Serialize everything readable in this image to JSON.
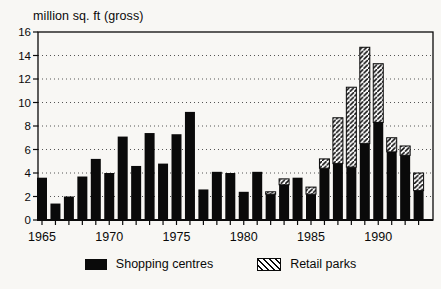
{
  "chart_data": {
    "type": "bar",
    "stacked": true,
    "title": "million sq. ft (gross)",
    "xlabel": "",
    "ylabel": "million sq. ft (gross)",
    "ylim": [
      0,
      16
    ],
    "ytick_step": 2,
    "grid": "dotted horizontal gridlines at each y tick",
    "legend_position": "bottom-center",
    "categories": [
      "1965",
      "1966",
      "1967",
      "1968",
      "1969",
      "1970",
      "1971",
      "1972",
      "1973",
      "1974",
      "1975",
      "1976",
      "1977",
      "1978",
      "1979",
      "1980",
      "1981",
      "1982",
      "1983",
      "1984",
      "1985",
      "1986",
      "1987",
      "1988",
      "1989",
      "1990",
      "1991",
      "1992",
      "1993"
    ],
    "xticks_labeled": [
      "1965",
      "1970",
      "1975",
      "1980",
      "1985",
      "1990"
    ],
    "series": [
      {
        "name": "Shopping centres",
        "style": "solid-black",
        "values": [
          3.6,
          1.4,
          2.0,
          3.7,
          5.2,
          4.0,
          7.1,
          4.6,
          7.4,
          4.8,
          7.3,
          9.2,
          2.6,
          4.1,
          4.0,
          2.4,
          4.1,
          2.2,
          3.0,
          3.6,
          2.2,
          4.4,
          4.8,
          4.5,
          6.5,
          8.3,
          5.8,
          5.5,
          2.5
        ]
      },
      {
        "name": "Retail parks",
        "style": "diagonal-hatch",
        "values": [
          0,
          0,
          0,
          0,
          0,
          0,
          0,
          0,
          0,
          0,
          0,
          0,
          0,
          0,
          0,
          0,
          0,
          0.2,
          0.5,
          0,
          0.6,
          0.8,
          3.9,
          6.8,
          8.2,
          5.0,
          1.2,
          0.8,
          1.5
        ]
      }
    ]
  },
  "colors": {
    "bar_fill": "#0a0a0a",
    "hatch_stroke": "#0a0a0a",
    "grid_dot": "#555555",
    "background": "#f8f7f4"
  }
}
